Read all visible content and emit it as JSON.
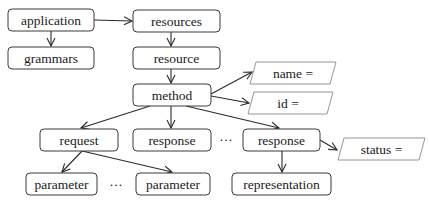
{
  "diagram": {
    "type": "tree",
    "nodes": [
      {
        "id": "application",
        "label": "application"
      },
      {
        "id": "grammars",
        "label": "grammars"
      },
      {
        "id": "resources",
        "label": "resources"
      },
      {
        "id": "resource",
        "label": "resource"
      },
      {
        "id": "method",
        "label": "method"
      },
      {
        "id": "request",
        "label": "request"
      },
      {
        "id": "response_1",
        "label": "response"
      },
      {
        "id": "response_2",
        "label": "response"
      },
      {
        "id": "parameter_1",
        "label": "parameter"
      },
      {
        "id": "parameter_2",
        "label": "parameter"
      },
      {
        "id": "representation",
        "label": "representation"
      }
    ],
    "attributes": [
      {
        "id": "name_attr",
        "label": "name ="
      },
      {
        "id": "id_attr",
        "label": "id ="
      },
      {
        "id": "status_attr",
        "label": "status ="
      }
    ],
    "ellipses": [
      "…",
      "…"
    ],
    "edges": [
      {
        "from": "application",
        "to": "grammars"
      },
      {
        "from": "application",
        "to": "resources"
      },
      {
        "from": "resources",
        "to": "resource"
      },
      {
        "from": "resource",
        "to": "method"
      },
      {
        "from": "method",
        "to": "name_attr"
      },
      {
        "from": "method",
        "to": "id_attr"
      },
      {
        "from": "method",
        "to": "request"
      },
      {
        "from": "method",
        "to": "response_1"
      },
      {
        "from": "method",
        "to": "response_2"
      },
      {
        "from": "request",
        "to": "parameter_1"
      },
      {
        "from": "request",
        "to": "parameter_2"
      },
      {
        "from": "response_2",
        "to": "status_attr"
      },
      {
        "from": "response_2",
        "to": "representation"
      }
    ]
  }
}
